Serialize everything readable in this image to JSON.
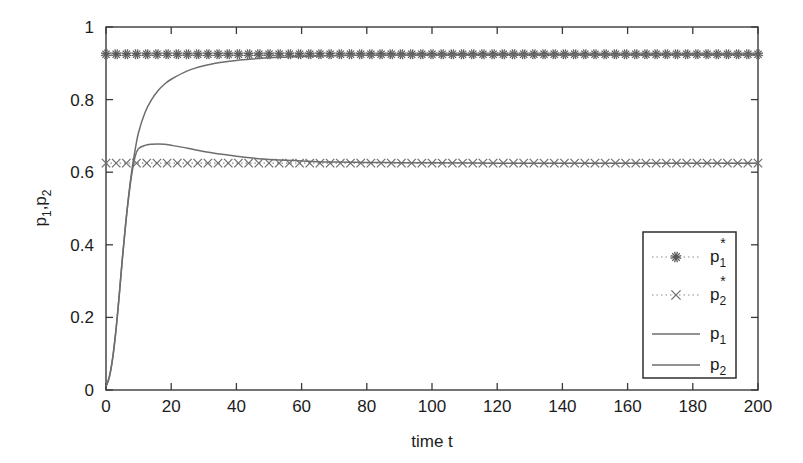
{
  "figure": {
    "background_color": "#ffffff",
    "line_color": "#6d6d6d",
    "axis_color": "#3a3a3a",
    "marker_color": "#5a5a5a"
  },
  "chart_data": {
    "type": "line",
    "title": "",
    "xlabel": "time t",
    "ylabel": "p_1,p_2",
    "ylabel_parts": {
      "base1": "p",
      "sub1": "1",
      "sep": ",",
      "base2": "p",
      "sub2": "2"
    },
    "xlim": [
      0,
      200
    ],
    "ylim": [
      0,
      1
    ],
    "xticks": [
      0,
      20,
      40,
      60,
      80,
      100,
      120,
      140,
      160,
      180,
      200
    ],
    "xtick_labels": [
      "0",
      "20",
      "40",
      "60",
      "80",
      "100",
      "120",
      "140",
      "160",
      "180",
      "200"
    ],
    "yticks": [
      0,
      0.2,
      0.4,
      0.6,
      0.8,
      1
    ],
    "ytick_labels": [
      "0",
      "0.2",
      "0.4",
      "0.6",
      "0.8",
      "1"
    ],
    "grid": false,
    "legend_position": "lower right",
    "equilibrium": {
      "p1_star": 0.925,
      "p2_star": 0.625,
      "marker_spacing_t": 3.125,
      "marker_count": 65
    },
    "series": [
      {
        "name": "p_1*",
        "display": "p",
        "subscript": "1",
        "superscript": "*",
        "style": "dotted-with-star-markers",
        "marker": "asterisk",
        "constant_value": 0.925,
        "x": [
          0,
          200
        ],
        "values": [
          0.925,
          0.925
        ]
      },
      {
        "name": "p_2*",
        "display": "p",
        "subscript": "2",
        "superscript": "*",
        "style": "dotted-with-x-markers",
        "marker": "x",
        "constant_value": 0.625,
        "x": [
          0,
          200
        ],
        "values": [
          0.625,
          0.625
        ]
      },
      {
        "name": "p_1",
        "display": "p",
        "subscript": "1",
        "superscript": "",
        "style": "solid",
        "marker": "none",
        "x": [
          0,
          1,
          2,
          3,
          4,
          5,
          6,
          7,
          8,
          9,
          10,
          12,
          14,
          16,
          18,
          20,
          25,
          30,
          35,
          40,
          45,
          50,
          55,
          60,
          65,
          70,
          75,
          80,
          90,
          100,
          120,
          140,
          160,
          180,
          200
        ],
        "values": [
          0.01,
          0.035,
          0.085,
          0.16,
          0.255,
          0.36,
          0.455,
          0.54,
          0.61,
          0.665,
          0.71,
          0.765,
          0.8,
          0.825,
          0.843,
          0.856,
          0.879,
          0.893,
          0.902,
          0.908,
          0.912,
          0.915,
          0.917,
          0.919,
          0.92,
          0.921,
          0.922,
          0.9225,
          0.923,
          0.9235,
          0.924,
          0.9245,
          0.9245,
          0.925,
          0.925
        ]
      },
      {
        "name": "p_2",
        "display": "p",
        "subscript": "2",
        "superscript": "",
        "style": "solid",
        "marker": "none",
        "x": [
          0,
          1,
          2,
          3,
          4,
          5,
          6,
          7,
          8,
          9,
          10,
          12,
          14,
          16,
          18,
          20,
          25,
          30,
          35,
          40,
          45,
          50,
          55,
          60,
          65,
          70,
          80,
          90,
          100,
          120,
          140,
          160,
          180,
          200
        ],
        "values": [
          0.01,
          0.035,
          0.085,
          0.16,
          0.255,
          0.36,
          0.455,
          0.535,
          0.6,
          0.645,
          0.665,
          0.674,
          0.677,
          0.678,
          0.677,
          0.674,
          0.666,
          0.657,
          0.65,
          0.644,
          0.639,
          0.635,
          0.633,
          0.631,
          0.629,
          0.628,
          0.627,
          0.626,
          0.626,
          0.625,
          0.625,
          0.625,
          0.625,
          0.625
        ]
      }
    ]
  }
}
